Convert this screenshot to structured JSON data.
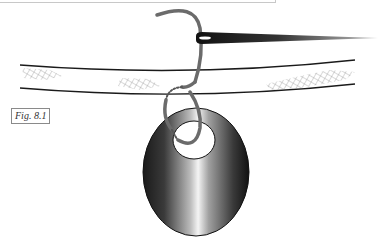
{
  "figure": {
    "label": "Fig. 8.1",
    "elements": [
      "needle",
      "thread",
      "strap",
      "pendant"
    ]
  },
  "colors": {
    "thread": "#6b6b6b",
    "outline": "#1a1a1a",
    "hatch": "#9a9a9a",
    "pendant_dark": "#222222",
    "pendant_light": "#f2f2f2"
  }
}
